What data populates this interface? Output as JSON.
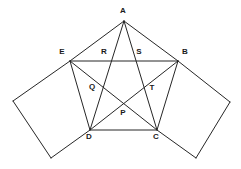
{
  "figure": {
    "background_color": "#ffffff",
    "stroke_color": "#262626",
    "label_color": "#1a1a1a",
    "width": 241,
    "height": 169,
    "points": {
      "A": {
        "label": "A",
        "x": 124,
        "y": 21,
        "label_x": 123,
        "label_y": 11
      },
      "E": {
        "label": "E",
        "x": 70,
        "y": 61,
        "label_x": 62,
        "label_y": 52
      },
      "B": {
        "label": "B",
        "x": 178,
        "y": 61,
        "label_x": 185,
        "label_y": 52
      },
      "D": {
        "label": "D",
        "x": 90,
        "y": 130,
        "label_x": 89,
        "label_y": 137
      },
      "C": {
        "label": "C",
        "x": 157,
        "y": 130,
        "label_x": 156,
        "label_y": 137
      },
      "R": {
        "label": "R",
        "x": 110,
        "y": 61,
        "label_x": 104,
        "label_y": 52
      },
      "S": {
        "label": "S",
        "x": 145,
        "y": 61,
        "label_x": 139,
        "label_y": 52
      },
      "Q": {
        "label": "Q",
        "x": 98,
        "y": 90,
        "label_x": 92,
        "label_y": 87
      },
      "T": {
        "label": "T",
        "x": 148,
        "y": 91,
        "label_x": 152,
        "label_y": 88
      },
      "P": {
        "label": "P",
        "x": 122,
        "y": 106,
        "label_x": 123,
        "label_y": 113
      },
      "F": {
        "label": "",
        "x": 13,
        "y": 101,
        "label_x": 13,
        "label_y": 101
      },
      "G": {
        "label": "",
        "x": 51,
        "y": 158,
        "label_x": 51,
        "label_y": 158
      },
      "H": {
        "label": "",
        "x": 230,
        "y": 102,
        "label_x": 230,
        "label_y": 102
      },
      "K": {
        "label": "",
        "x": 196,
        "y": 158,
        "label_x": 196,
        "label_y": 158
      }
    },
    "segments": [
      {
        "name": "side-A-E",
        "from": "A",
        "to": "E"
      },
      {
        "name": "side-A-B",
        "from": "A",
        "to": "B"
      },
      {
        "name": "chord-E-B",
        "from": "E",
        "to": "B"
      },
      {
        "name": "side-E-D",
        "from": "E",
        "to": "D"
      },
      {
        "name": "side-B-C",
        "from": "B",
        "to": "C"
      },
      {
        "name": "base-D-C",
        "from": "D",
        "to": "C"
      },
      {
        "name": "cevian-A-D",
        "from": "A",
        "to": "D"
      },
      {
        "name": "cevian-A-C",
        "from": "A",
        "to": "C"
      },
      {
        "name": "diagonal-E-C",
        "from": "E",
        "to": "C"
      },
      {
        "name": "diagonal-B-D",
        "from": "B",
        "to": "D"
      },
      {
        "name": "square-left-E-F",
        "from": "E",
        "to": "F"
      },
      {
        "name": "square-left-F-G",
        "from": "F",
        "to": "G"
      },
      {
        "name": "square-left-G-D",
        "from": "G",
        "to": "D"
      },
      {
        "name": "square-right-B-H",
        "from": "B",
        "to": "H"
      },
      {
        "name": "square-right-H-K",
        "from": "H",
        "to": "K"
      },
      {
        "name": "square-right-K-C",
        "from": "K",
        "to": "C"
      }
    ],
    "vertex_labels": [
      "A",
      "E",
      "B",
      "D",
      "C",
      "R",
      "S",
      "Q",
      "T",
      "P"
    ]
  }
}
